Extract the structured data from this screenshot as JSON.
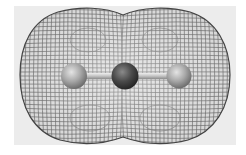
{
  "figure": {
    "atoms": [
      {
        "position": "left",
        "shade": "light-gray"
      },
      {
        "position": "center",
        "shade": "dark-gray"
      },
      {
        "position": "right",
        "shade": "light-gray"
      }
    ],
    "bonds": 2,
    "surface_style": "wireframe mesh",
    "colors": {
      "background": "#ffffff",
      "panel": "#ececec",
      "mesh": "#555555",
      "outer_atom": "#9a9a9a",
      "center_atom": "#4a4a4a",
      "bond": "#c8c8c8"
    }
  }
}
